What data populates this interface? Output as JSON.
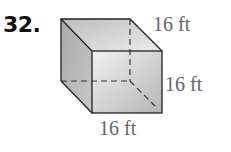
{
  "problem": {
    "number": "32."
  },
  "figure": {
    "shape": "cube",
    "labels": {
      "depth": "16 ft",
      "height": "16 ft",
      "width": "16 ft"
    },
    "colors": {
      "edge": "#222222",
      "hidden_edge": "#333333",
      "face_light": "#e6e6e6",
      "face_dark": "#a9a9a9"
    }
  }
}
